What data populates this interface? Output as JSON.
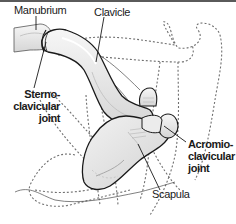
{
  "figure": {
    "colors": {
      "bone_fill": "#e4e4e4",
      "bone_highlight": "#f4f4f4",
      "outline": "#1a1a1a",
      "dashed_outline": "#6a6a6a",
      "top_bar": "#5a5a5a"
    }
  },
  "labels": {
    "manubrium": "Manubrium",
    "clavicle": "Clavicle",
    "scapula": "Scapula",
    "sternoclavicular": {
      "line1": "Sterno-",
      "line2": "clavicular",
      "line3": "joint"
    },
    "acromioclavicular": {
      "line1": "Acromio-",
      "line2": "clavicular",
      "line3": "joint"
    }
  }
}
